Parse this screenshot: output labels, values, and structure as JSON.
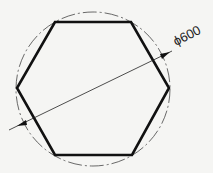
{
  "diagram": {
    "type": "engineering-drawing",
    "shape": "hexagon",
    "circumscribed_circle": {
      "line_style": "dash-dot"
    },
    "dimension": {
      "label": "ϕ600",
      "measures": "circle diameter",
      "value": 600
    },
    "colors": {
      "line": "#111111",
      "background": "#f5f5f3"
    }
  }
}
